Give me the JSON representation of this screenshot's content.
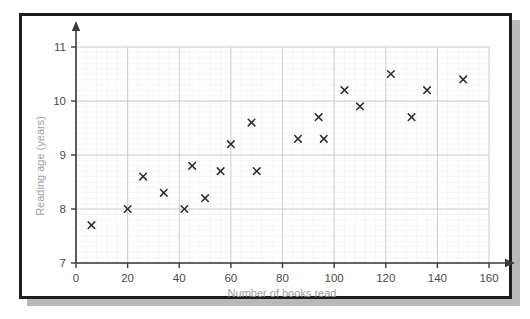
{
  "figure": {
    "frame_color": "#1d1d1d",
    "shadow_color": "#b9b9b9",
    "background": "#ffffff"
  },
  "chart_data": {
    "type": "scatter",
    "title": "",
    "xlabel": "Number of books read",
    "ylabel": "Reading age (years)",
    "xlim": [
      0,
      160
    ],
    "ylim": [
      7,
      11
    ],
    "xticks": [
      0,
      20,
      40,
      60,
      80,
      100,
      120,
      140,
      160
    ],
    "xticklabels": [
      "0",
      "20",
      "40",
      "60",
      "80",
      "100",
      "120",
      "140",
      "160"
    ],
    "yticks": [
      7,
      8,
      9,
      10,
      11
    ],
    "yticklabels": [
      "7",
      "8",
      "9",
      "10",
      "11"
    ],
    "grid": true,
    "grid_major_color": "#c8c8cc",
    "grid_minor_color": "#eeeef1",
    "x_minor_step": 4,
    "y_minor_step": 0.1,
    "legend": null,
    "marker": "x",
    "marker_color": "#2b2b2b",
    "points": [
      {
        "x": 6,
        "y": 7.7
      },
      {
        "x": 20,
        "y": 8.0
      },
      {
        "x": 26,
        "y": 8.6
      },
      {
        "x": 34,
        "y": 8.3
      },
      {
        "x": 42,
        "y": 8.0
      },
      {
        "x": 45,
        "y": 8.8
      },
      {
        "x": 50,
        "y": 8.2
      },
      {
        "x": 56,
        "y": 8.7
      },
      {
        "x": 60,
        "y": 9.2
      },
      {
        "x": 68,
        "y": 9.6
      },
      {
        "x": 70,
        "y": 8.7
      },
      {
        "x": 86,
        "y": 9.3
      },
      {
        "x": 94,
        "y": 9.7
      },
      {
        "x": 96,
        "y": 9.3
      },
      {
        "x": 104,
        "y": 10.2
      },
      {
        "x": 110,
        "y": 9.9
      },
      {
        "x": 122,
        "y": 10.5
      },
      {
        "x": 130,
        "y": 9.7
      },
      {
        "x": 136,
        "y": 10.2
      },
      {
        "x": 150,
        "y": 10.4
      }
    ]
  }
}
